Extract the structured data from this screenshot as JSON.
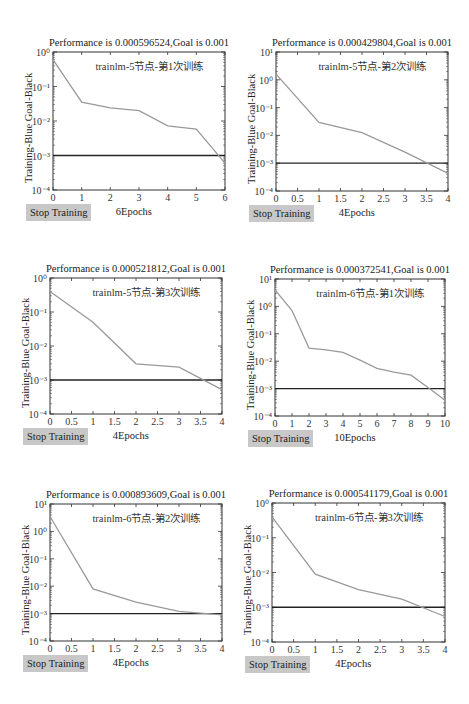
{
  "colors": {
    "training_line": "#9a9a9a",
    "goal_line": "#222222",
    "axes": "#333333",
    "button_bg": "#c8c8c8"
  },
  "chart_data": [
    {
      "type": "line",
      "title": "Performance is 0.000596524,Goal is 0.001",
      "annotation": "trainlm-5节点-第1次训练",
      "xlabel": "6Epochs",
      "ylabel": "Training-Blue Goal-Black",
      "button": "Stop Training",
      "xlim": [
        0,
        6
      ],
      "xticks": [
        "0",
        "1",
        "2",
        "3",
        "4",
        "5",
        "6"
      ],
      "ylim_exp": [
        -4,
        0
      ],
      "yticks": [
        "10⁻⁴",
        "10⁻³",
        "10⁻²",
        "10⁻¹",
        "10⁰"
      ],
      "grid": false,
      "series": [
        {
          "name": "Training",
          "x": [
            0,
            1,
            2,
            3,
            4,
            5,
            6
          ],
          "y": [
            0.6,
            0.035,
            0.024,
            0.02,
            0.0072,
            0.0058,
            0.000596524
          ]
        },
        {
          "name": "Goal",
          "x": [
            0,
            6
          ],
          "y": [
            0.001,
            0.001
          ]
        }
      ]
    },
    {
      "type": "line",
      "title": "Performance is 0.000429804,Goal is 0.001",
      "annotation": "trainlm-5节点-第2次训练",
      "xlabel": "4Epochs",
      "ylabel": "Training-Blue Goal-Black",
      "button": "Stop Training",
      "xlim": [
        0,
        4
      ],
      "xticks": [
        "0",
        "0.5",
        "1",
        "1.5",
        "2",
        "2.5",
        "3",
        "3.5",
        "4"
      ],
      "ylim_exp": [
        -4,
        1
      ],
      "yticks": [
        "10⁻⁴",
        "10⁻³",
        "10⁻²",
        "10⁻¹",
        "10⁰",
        "10¹"
      ],
      "grid": false,
      "series": [
        {
          "name": "Training",
          "x": [
            0,
            1,
            2,
            3,
            4
          ],
          "y": [
            1.6,
            0.029,
            0.0125,
            0.0025,
            0.000429804
          ]
        },
        {
          "name": "Goal",
          "x": [
            0,
            4
          ],
          "y": [
            0.001,
            0.001
          ]
        }
      ]
    },
    {
      "type": "line",
      "title": "Performance is 0.000521812,Goal is 0.001",
      "annotation": "trainlm-5节点-第3次训练",
      "xlabel": "4Epochs",
      "ylabel": "Training-Blue Goal-Black",
      "button": "Stop Training",
      "xlim": [
        0,
        4
      ],
      "xticks": [
        "0",
        "0.5",
        "1",
        "1.5",
        "2",
        "2.5",
        "3",
        "3.5",
        "4"
      ],
      "ylim_exp": [
        -4,
        0
      ],
      "yticks": [
        "10⁻⁴",
        "10⁻³",
        "10⁻²",
        "10⁻¹",
        "10⁰"
      ],
      "grid": false,
      "series": [
        {
          "name": "Training",
          "x": [
            0,
            1,
            2,
            3,
            4
          ],
          "y": [
            0.4,
            0.05,
            0.003,
            0.0024,
            0.000521812
          ]
        },
        {
          "name": "Goal",
          "x": [
            0,
            4
          ],
          "y": [
            0.001,
            0.001
          ]
        }
      ]
    },
    {
      "type": "line",
      "title": "Performance is 0.000372541,Goal is 0.001",
      "annotation": "trainlm-6节点-第1次训练",
      "xlabel": "10Epochs",
      "ylabel": "Training-Blue Goal-Black",
      "button": "Stop Training",
      "xlim": [
        0,
        10
      ],
      "xticks": [
        "0",
        "1",
        "2",
        "3",
        "4",
        "5",
        "6",
        "7",
        "8",
        "9",
        "10"
      ],
      "ylim_exp": [
        -4,
        1
      ],
      "yticks": [
        "10⁻⁴",
        "10⁻³",
        "10⁻²",
        "10⁻¹",
        "10⁰",
        "10¹"
      ],
      "grid": false,
      "series": [
        {
          "name": "Training",
          "x": [
            0,
            1,
            2,
            3,
            4,
            5,
            6,
            7,
            8,
            9,
            10
          ],
          "y": [
            4,
            0.7,
            0.03,
            0.026,
            0.021,
            0.011,
            0.0055,
            0.004,
            0.0031,
            0.0011,
            0.000372541
          ]
        },
        {
          "name": "Goal",
          "x": [
            0,
            10
          ],
          "y": [
            0.001,
            0.001
          ]
        }
      ]
    },
    {
      "type": "line",
      "title": "Performance is 0.000893609,Goal is 0.001",
      "annotation": "trainlm-6节点-第2次训练",
      "xlabel": "4Epochs",
      "ylabel": "Training-Blue Goal-Black",
      "button": "Stop Training",
      "xlim": [
        0,
        4
      ],
      "xticks": [
        "0",
        "0.5",
        "1",
        "1.5",
        "2",
        "2.5",
        "3",
        "3.5",
        "4"
      ],
      "ylim_exp": [
        -4,
        1
      ],
      "yticks": [
        "10⁻⁴",
        "10⁻³",
        "10⁻²",
        "10⁻¹",
        "10⁰",
        "10¹"
      ],
      "grid": false,
      "series": [
        {
          "name": "Training",
          "x": [
            0,
            1,
            2,
            3,
            4
          ],
          "y": [
            3.5,
            0.008,
            0.0026,
            0.0012,
            0.000893609
          ]
        },
        {
          "name": "Goal",
          "x": [
            0,
            4
          ],
          "y": [
            0.001,
            0.001
          ]
        }
      ]
    },
    {
      "type": "line",
      "title": "Performance is 0.000541179,Goal is 0.001",
      "annotation": "trainlm-6节点-第3次训练",
      "xlabel": "4Epochs",
      "ylabel": "Training-Blue Goal-Black",
      "button": "Stop Training",
      "xlim": [
        0,
        4
      ],
      "xticks": [
        "0",
        "0.5",
        "1",
        "1.5",
        "2",
        "2.5",
        "3",
        "3.5",
        "4"
      ],
      "ylim_exp": [
        -4,
        0
      ],
      "yticks": [
        "10⁻⁴",
        "10⁻³",
        "10⁻²",
        "10⁻¹",
        "10⁰"
      ],
      "grid": false,
      "series": [
        {
          "name": "Training",
          "x": [
            0,
            1,
            2,
            3,
            4
          ],
          "y": [
            0.4,
            0.009,
            0.0032,
            0.0017,
            0.000541179
          ]
        },
        {
          "name": "Goal",
          "x": [
            0,
            4
          ],
          "y": [
            0.001,
            0.001
          ]
        }
      ]
    }
  ],
  "layout": [
    {
      "plot": [
        53,
        52,
        225,
        190
      ]
    },
    {
      "plot": [
        276,
        52,
        448,
        191
      ]
    },
    {
      "plot": [
        50,
        278,
        222,
        414
      ]
    },
    {
      "plot": [
        275,
        279,
        445,
        416
      ]
    },
    {
      "plot": [
        50,
        504,
        222,
        641
      ]
    },
    {
      "plot": [
        272,
        503,
        445,
        642
      ]
    }
  ]
}
